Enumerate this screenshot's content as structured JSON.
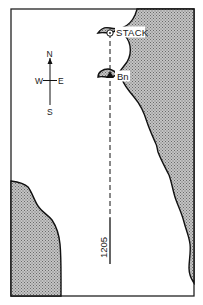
{
  "map": {
    "labels": {
      "stack": "STACK",
      "beacon": "Bn",
      "bearing": "1205"
    },
    "compass": {
      "north": "N",
      "south": "S",
      "east": "E",
      "west": "W"
    },
    "colors": {
      "land_fill": "#a8a8a8",
      "water": "#ffffff",
      "coastline": "#111111",
      "frame": "#222222"
    },
    "features": [
      {
        "type": "stack",
        "symbol": "circle-with-dot",
        "label": "STACK"
      },
      {
        "type": "beacon",
        "symbol": "filled-triangle",
        "label": "Bn"
      },
      {
        "type": "leading-line",
        "style": "dashed-then-solid",
        "label": "1205"
      }
    ]
  }
}
